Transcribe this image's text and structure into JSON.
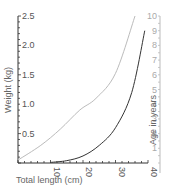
{
  "chart_data": {
    "type": "line",
    "title": "",
    "xlabel": "Total length (cm)",
    "ylabel": "Weight (kg)",
    "y2label": "Age in years",
    "xlim": [
      0,
      40
    ],
    "ylim": [
      0,
      2.5
    ],
    "y2lim": [
      0,
      10
    ],
    "x_ticks": [
      10,
      20,
      30,
      40
    ],
    "y_ticks": [
      "0.5",
      "1.0",
      "1.5",
      "2.0",
      "2.5"
    ],
    "y2_ticks": [
      "1",
      "2",
      "3",
      "4",
      "5",
      "6",
      "7",
      "8",
      "9",
      "10"
    ],
    "grid": false,
    "legend": null,
    "series": [
      {
        "name": "Weight",
        "axis": "left",
        "color": "#333333",
        "x": [
          10,
          15,
          20,
          25,
          30,
          35,
          39
        ],
        "values": [
          0.01,
          0.04,
          0.12,
          0.3,
          0.6,
          1.2,
          2.25
        ]
      },
      {
        "name": "Age",
        "axis": "right",
        "color": "#bbbbbb",
        "x": [
          0,
          7,
          13,
          19,
          24,
          30,
          36
        ],
        "values": [
          0.2,
          1.2,
          2.3,
          3.6,
          4.4,
          6.1,
          10
        ]
      }
    ]
  }
}
